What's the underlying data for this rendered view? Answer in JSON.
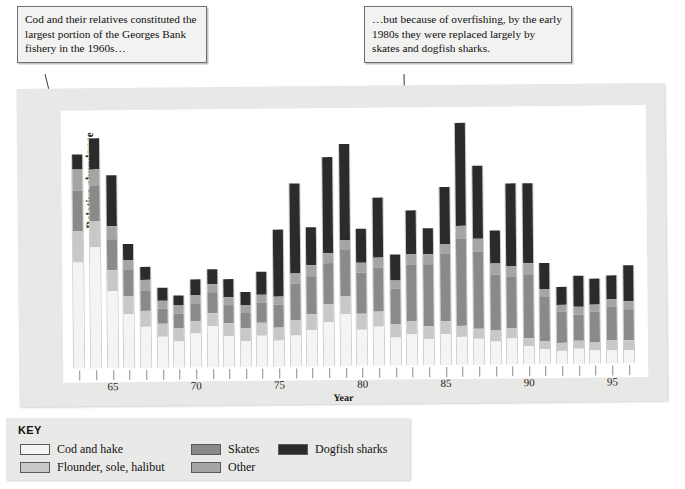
{
  "callouts": {
    "left": "Cod and their relatives constituted the largest portion of the Georges Bank fishery in the 1960s…",
    "right": "…but because of overfishing, by the early 1980s they were replaced largely by skates and dogfish sharks."
  },
  "axes": {
    "ylabel": "Relative abundance",
    "xlabel": "Year"
  },
  "key": {
    "title": "KEY",
    "items": [
      {
        "label": "Cod and hake",
        "color": "#f4f4f2"
      },
      {
        "label": "Flounder, sole, halibut",
        "color": "#c8c8c6"
      },
      {
        "label": "Skates",
        "color": "#8a8a88"
      },
      {
        "label": "Other",
        "color": "#a5a5a3"
      },
      {
        "label": "Dogfish sharks",
        "color": "#2b2b2b"
      }
    ]
  },
  "chart_data": {
    "type": "bar",
    "stacked": true,
    "title": "",
    "xlabel": "Year",
    "ylabel": "Relative abundance",
    "grid": false,
    "legend_position": "below",
    "xlim": [
      63,
      96
    ],
    "ylim": [
      0,
      100
    ],
    "xticks": [
      65,
      70,
      75,
      80,
      85,
      90,
      95
    ],
    "categories": [
      63,
      64,
      65,
      66,
      67,
      68,
      69,
      70,
      71,
      72,
      73,
      74,
      75,
      76,
      77,
      78,
      79,
      80,
      81,
      82,
      83,
      84,
      85,
      86,
      87,
      88,
      89,
      90,
      91,
      92,
      93,
      94,
      95,
      96
    ],
    "series": [
      {
        "name": "Cod and hake",
        "color": "#f4f4f2",
        "values": [
          41,
          47,
          30,
          21,
          16,
          12,
          10,
          13,
          16,
          12,
          10,
          12,
          10,
          12,
          14,
          17,
          20,
          14,
          15,
          11,
          12,
          10,
          12,
          11,
          10,
          9,
          10,
          7,
          6,
          5,
          6,
          5,
          5,
          5
        ]
      },
      {
        "name": "Flounder, sole, halibut",
        "color": "#c8c8c6",
        "values": [
          12,
          10,
          8,
          7,
          6,
          5,
          5,
          5,
          5,
          5,
          5,
          5,
          5,
          6,
          6,
          7,
          7,
          6,
          6,
          5,
          5,
          5,
          5,
          4,
          4,
          4,
          4,
          3,
          3,
          3,
          3,
          3,
          4,
          4
        ]
      },
      {
        "name": "Skates",
        "color": "#8a8a88",
        "values": [
          16,
          14,
          12,
          10,
          8,
          6,
          6,
          7,
          8,
          7,
          6,
          8,
          9,
          14,
          15,
          16,
          18,
          16,
          17,
          14,
          22,
          24,
          26,
          34,
          30,
          22,
          20,
          25,
          17,
          12,
          10,
          12,
          13,
          12
        ]
      },
      {
        "name": "Other",
        "color": "#a5a5a3",
        "values": [
          8,
          6,
          5,
          4,
          4,
          3,
          3,
          3,
          3,
          3,
          3,
          3,
          3,
          4,
          4,
          4,
          4,
          4,
          4,
          3,
          4,
          4,
          4,
          5,
          5,
          4,
          4,
          4,
          3,
          3,
          3,
          3,
          3,
          3
        ]
      },
      {
        "name": "Dogfish sharks",
        "color": "#2b2b2b",
        "values": [
          6,
          12,
          20,
          6,
          5,
          5,
          4,
          6,
          6,
          7,
          5,
          9,
          26,
          35,
          15,
          37,
          37,
          13,
          23,
          10,
          17,
          10,
          22,
          40,
          28,
          13,
          32,
          31,
          10,
          7,
          12,
          10,
          9,
          14
        ]
      }
    ]
  }
}
